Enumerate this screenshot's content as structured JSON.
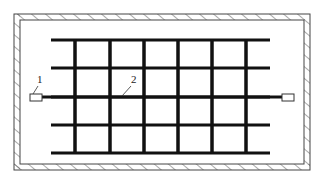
{
  "diagram": {
    "labels": [
      {
        "id": "1",
        "text": "1",
        "x": 37,
        "y": 83,
        "leader": [
          38,
          86,
          33,
          94
        ]
      },
      {
        "id": "2",
        "text": "2",
        "x": 131,
        "y": 83,
        "leader": [
          131,
          86,
          122,
          96
        ]
      }
    ],
    "wall": {
      "outer": [
        14,
        14,
        296,
        156
      ],
      "thickness": 6,
      "color": "#444444"
    },
    "grid": {
      "color": "#111111",
      "horizontal_y": [
        40,
        68,
        97,
        125,
        153
      ],
      "h_x_start": 51,
      "h_x_end": 270,
      "vertical_x": [
        75,
        110,
        144,
        178,
        212,
        246
      ],
      "v_y_start": 40,
      "v_y_end": 153
    },
    "sensor_line": {
      "y": 97,
      "x_start": 40,
      "x_end": 284
    },
    "sensors": [
      {
        "name": "left-sensor",
        "x": 30,
        "y": 94,
        "w": 12,
        "h": 7
      },
      {
        "name": "right-sensor",
        "x": 282,
        "y": 94,
        "w": 12,
        "h": 7
      }
    ]
  }
}
